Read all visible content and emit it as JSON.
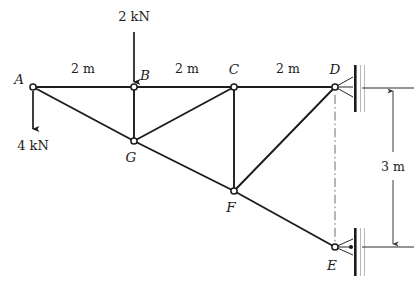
{
  "figure": {
    "type": "structural-truss-free-body-diagram",
    "background_color": "#ffffff",
    "line_color": "#1c1c1c"
  },
  "nodes": [
    {
      "id": "A",
      "label": "A",
      "x": 33,
      "y": 87,
      "label_x": 19,
      "label_y": 84,
      "joint_r": 3.1
    },
    {
      "id": "B",
      "label": "B",
      "x": 134,
      "y": 87,
      "label_x": 141,
      "label_y": 79,
      "joint_r": 3.1
    },
    {
      "id": "C",
      "label": "C",
      "x": 234,
      "y": 87,
      "label_x": 228,
      "label_y": 72,
      "joint_r": 3.1
    },
    {
      "id": "D",
      "label": "D",
      "x": 335,
      "y": 87,
      "label_x": 329,
      "label_y": 72,
      "joint_r": 3.1
    },
    {
      "id": "G",
      "label": "G",
      "x": 134,
      "y": 141,
      "label_x": 128,
      "label_y": 161,
      "joint_r": 3.1
    },
    {
      "id": "F",
      "label": "F",
      "x": 234,
      "y": 191,
      "label_x": 228,
      "label_y": 211,
      "joint_r": 3.1
    },
    {
      "id": "E",
      "label": "E",
      "x": 335,
      "y": 247,
      "label_x": 329,
      "label_y": 268,
      "joint_r": 3.1
    }
  ],
  "members": [
    {
      "name": "member-A-B",
      "from": "A",
      "to": "B",
      "style": "chord"
    },
    {
      "name": "member-B-C",
      "from": "B",
      "to": "C",
      "style": "chord"
    },
    {
      "name": "member-C-D",
      "from": "C",
      "to": "D",
      "style": "chord"
    },
    {
      "name": "member-A-G",
      "from": "A",
      "to": "G",
      "style": "member"
    },
    {
      "name": "member-G-F",
      "from": "G",
      "to": "F",
      "style": "member"
    },
    {
      "name": "member-F-E",
      "from": "F",
      "to": "E",
      "style": "member"
    },
    {
      "name": "member-B-G",
      "from": "B",
      "to": "G",
      "style": "member"
    },
    {
      "name": "member-G-C",
      "from": "G",
      "to": "C",
      "style": "member"
    },
    {
      "name": "member-C-F",
      "from": "C",
      "to": "F",
      "style": "member"
    },
    {
      "name": "member-F-D",
      "from": "F",
      "to": "D",
      "style": "member"
    }
  ],
  "loads": [
    {
      "name": "load-2kN-at-B",
      "label": "2 kN",
      "magnitude": 2,
      "unit": "kN",
      "direction": "down",
      "at_node": "B",
      "arrow_x": 134,
      "arrow_y_start": 32,
      "arrow_y_end": 84,
      "text_x": 134,
      "text_y": 19
    },
    {
      "name": "load-4kN-at-A",
      "label": "4 kN",
      "magnitude": 4,
      "unit": "kN",
      "direction": "down",
      "at_node": "A",
      "arrow_x": 33,
      "arrow_y_start": 90,
      "arrow_y_end": 131,
      "text_x": 33,
      "text_y": 148
    }
  ],
  "span_dimensions": [
    {
      "name": "dim-A-B",
      "label": "2 m",
      "value": 2,
      "unit": "m",
      "text_x": 83,
      "text_y": 71
    },
    {
      "name": "dim-B-C",
      "label": "2 m",
      "value": 2,
      "unit": "m",
      "text_x": 184,
      "text_y": 71
    },
    {
      "name": "dim-C-D",
      "label": "2 m",
      "value": 2,
      "unit": "m",
      "text_x": 285,
      "text_y": 71
    }
  ],
  "height_dimension": {
    "name": "dim-D-E-height",
    "label": "3 m",
    "value": 3,
    "unit": "m",
    "line_x": 393,
    "y_top": 88,
    "y_bottom": 247,
    "text_x": 393,
    "text_y": 166,
    "ext_top_x1": 360,
    "ext_top_x2": 414,
    "ext_bottom_x1": 360,
    "ext_bottom_x2": 414
  },
  "center_line": {
    "name": "centerline-D-E",
    "x": 335,
    "y_top": 95,
    "y_bottom": 243
  },
  "supports": [
    {
      "name": "support-D-wall",
      "at_node": "D",
      "type": "pin-on-wall",
      "plate_x": 354,
      "plate_y_top": 65,
      "plate_y_bottom": 112,
      "plate_width": 2.6,
      "hatch_width": 11,
      "link_from_x": 335,
      "link_from_y": 87,
      "link_to_x": 353,
      "link_to_y_top": 76,
      "link_to_y_bottom": 98
    },
    {
      "name": "support-E-wall",
      "at_node": "E",
      "type": "pin-on-wall",
      "plate_x": 354,
      "plate_y_top": 228,
      "plate_y_bottom": 276,
      "plate_width": 2.6,
      "hatch_width": 11,
      "link_from_x": 335,
      "link_from_y": 247,
      "link_to_x": 353,
      "link_to_y_top": 238,
      "link_to_y_bottom": 256,
      "pin_dot_x": 352,
      "pin_dot_y": 247,
      "pin_dot_r": 2.0
    }
  ]
}
